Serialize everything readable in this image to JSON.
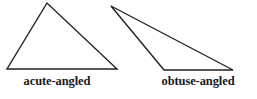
{
  "figure": {
    "stroke_color": "#222222",
    "background_color": "#ffffff",
    "triangles": [
      {
        "id": "acute",
        "label": "acute-angled",
        "kind": "acute"
      },
      {
        "id": "obtuse",
        "label": "obtuse-angled",
        "kind": "obtuse"
      }
    ]
  }
}
